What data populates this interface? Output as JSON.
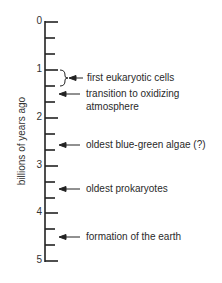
{
  "axis": {
    "label": "billions of years ago",
    "ticks": [
      "0",
      "1",
      "2",
      "3",
      "4",
      "5"
    ]
  },
  "events": [
    {
      "label": "first eukaryotic cells",
      "value": "1.0–1.33",
      "type": "bracket"
    },
    {
      "label_line1": "transition to oxidizing",
      "label_line2": "atmosphere",
      "value": "1.5"
    },
    {
      "label": "oldest blue-green algae (?)",
      "value": "2.67"
    },
    {
      "label": "oldest prokaryotes",
      "value": "3.5"
    },
    {
      "label": "formation of the earth",
      "value": "4.5"
    }
  ]
}
